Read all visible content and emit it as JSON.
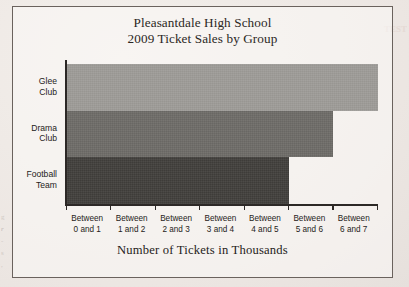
{
  "figure": {
    "title_line1": "Pleasantdale High School",
    "title_line2": "2009 Ticket Sales by Group",
    "x_axis_title": "Number of Tickets in Thousands"
  },
  "margin_artifacts": {
    "left": [
      "g",
      "r",
      "-",
      "s",
      ","
    ],
    "top_right": "TEST"
  },
  "chart_data": {
    "type": "bar",
    "orientation": "horizontal",
    "title": "Pleasantdale High School 2009 Ticket Sales by Group",
    "xlabel": "Number of Tickets in Thousands",
    "ylabel": "",
    "categories": [
      "Glee Club",
      "Drama Club",
      "Football Team"
    ],
    "category_lines": [
      [
        "Glee",
        "Club"
      ],
      [
        "Drama",
        "Club"
      ],
      [
        "Football",
        "Team"
      ]
    ],
    "values": [
      7.0,
      6.0,
      5.0
    ],
    "bar_colors": [
      "#9d9b97",
      "#6d6b67",
      "#403e3b"
    ],
    "xlim": [
      0,
      7
    ],
    "x_tick_values": [
      0,
      1,
      2,
      3,
      4,
      5,
      6,
      7
    ],
    "x_tick_labels": [
      [
        "Between",
        "0 and 1"
      ],
      [
        "Between",
        "1 and 2"
      ],
      [
        "Between",
        "2 and 3"
      ],
      [
        "Between",
        "3 and 4"
      ],
      [
        "Between",
        "4 and 5"
      ],
      [
        "Between",
        "5 and 6"
      ],
      [
        "Between",
        "6 and 7"
      ]
    ],
    "x_tick_labels_flat": [
      "Between 0 and 1",
      "Between 1 and 2",
      "Between 2 and 3",
      "Between 3 and 4",
      "Between 4 and 5",
      "Between 5 and 6",
      "Between 6 and 7"
    ],
    "grid": false,
    "legend": false
  }
}
